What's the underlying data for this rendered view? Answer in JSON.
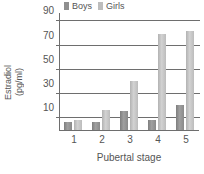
{
  "chart_data": {
    "type": "bar",
    "title": "",
    "subtitle": "",
    "xlabel": "Pubertal stage",
    "ylabel": "Estradiol (pg/ml)",
    "ylabel_line1": "Estradiol",
    "ylabel_line2": "(pg/ml)",
    "categories": [
      "1",
      "2",
      "3",
      "4",
      "5"
    ],
    "series": [
      {
        "name": "Boys",
        "color": "#8f8f8f",
        "values": [
          7,
          7,
          16,
          8,
          21
        ]
      },
      {
        "name": "Girls",
        "color": "#bdbdbd",
        "values": [
          8,
          17,
          41,
          80,
          82
        ]
      }
    ],
    "ylim": [
      0,
      97
    ],
    "yticks": [
      10,
      30,
      50,
      70,
      90
    ],
    "ytick_labels": [
      "10",
      "30",
      "50",
      "70",
      "90"
    ],
    "grid": true,
    "grid_axis": "y",
    "legend_position": "top"
  },
  "legend": {
    "entries": [
      {
        "label": "Boys"
      },
      {
        "label": "Girls"
      }
    ]
  },
  "axes": {
    "y_title_line1": "Estradiol",
    "y_title_line2": "(pg/ml)",
    "x_title": "Pubertal stage"
  }
}
